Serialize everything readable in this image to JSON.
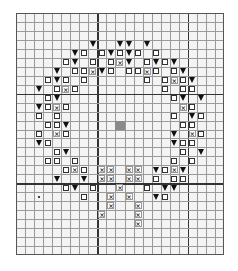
{
  "chart": {
    "columns": 23,
    "rows": 27,
    "thick_lines_cols": [
      9,
      19
    ],
    "thick_lines_rows": [
      9,
      19
    ],
    "colors": {
      "background": "#f4f4f4",
      "grid": "#9a9a9a",
      "thick_grid": "#333333",
      "triangle": "#111111",
      "center_fill": "#8a8a8a"
    },
    "legend_symbols": {
      "tri": "solid-down-triangle",
      "sq": "hollow-square",
      "x": "cross-in-box",
      "fill": "grey-filled-center",
      "dot": "stray-dot"
    },
    "cells": [
      {
        "r": 3,
        "c": 8,
        "s": "tri"
      },
      {
        "r": 3,
        "c": 11,
        "s": "tri"
      },
      {
        "r": 3,
        "c": 12,
        "s": "tri"
      },
      {
        "r": 3,
        "c": 14,
        "s": "tri"
      },
      {
        "r": 4,
        "c": 6,
        "s": "tri"
      },
      {
        "r": 4,
        "c": 7,
        "s": "sq"
      },
      {
        "r": 4,
        "c": 9,
        "s": "sq"
      },
      {
        "r": 4,
        "c": 10,
        "s": "tri"
      },
      {
        "r": 4,
        "c": 11,
        "s": "sq"
      },
      {
        "r": 4,
        "c": 12,
        "s": "tri"
      },
      {
        "r": 4,
        "c": 13,
        "s": "sq"
      },
      {
        "r": 4,
        "c": 15,
        "s": "sq"
      },
      {
        "r": 5,
        "c": 5,
        "s": "sq"
      },
      {
        "r": 5,
        "c": 6,
        "s": "tri"
      },
      {
        "r": 5,
        "c": 8,
        "s": "sq"
      },
      {
        "r": 5,
        "c": 10,
        "s": "sq"
      },
      {
        "r": 5,
        "c": 11,
        "s": "x"
      },
      {
        "r": 5,
        "c": 12,
        "s": "tri"
      },
      {
        "r": 5,
        "c": 14,
        "s": "sq"
      },
      {
        "r": 5,
        "c": 15,
        "s": "tri"
      },
      {
        "r": 5,
        "c": 16,
        "s": "sq"
      },
      {
        "r": 5,
        "c": 17,
        "s": "tri"
      },
      {
        "r": 6,
        "c": 4,
        "s": "tri"
      },
      {
        "r": 6,
        "c": 6,
        "s": "sq"
      },
      {
        "r": 6,
        "c": 7,
        "s": "sq"
      },
      {
        "r": 6,
        "c": 8,
        "s": "x"
      },
      {
        "r": 6,
        "c": 9,
        "s": "tri"
      },
      {
        "r": 6,
        "c": 10,
        "s": "sq"
      },
      {
        "r": 6,
        "c": 12,
        "s": "sq"
      },
      {
        "r": 6,
        "c": 13,
        "s": "sq"
      },
      {
        "r": 6,
        "c": 14,
        "s": "x"
      },
      {
        "r": 6,
        "c": 15,
        "s": "sq"
      },
      {
        "r": 6,
        "c": 17,
        "s": "sq"
      },
      {
        "r": 6,
        "c": 18,
        "s": "tri"
      },
      {
        "r": 7,
        "c": 3,
        "s": "sq"
      },
      {
        "r": 7,
        "c": 4,
        "s": "tri"
      },
      {
        "r": 7,
        "c": 5,
        "s": "sq"
      },
      {
        "r": 7,
        "c": 7,
        "s": "sq"
      },
      {
        "r": 7,
        "c": 14,
        "s": "sq"
      },
      {
        "r": 7,
        "c": 16,
        "s": "sq"
      },
      {
        "r": 7,
        "c": 17,
        "s": "x"
      },
      {
        "r": 7,
        "c": 18,
        "s": "sq"
      },
      {
        "r": 7,
        "c": 19,
        "s": "tri"
      },
      {
        "r": 8,
        "c": 2,
        "s": "tri"
      },
      {
        "r": 8,
        "c": 4,
        "s": "sq"
      },
      {
        "r": 8,
        "c": 5,
        "s": "x"
      },
      {
        "r": 8,
        "c": 6,
        "s": "sq"
      },
      {
        "r": 8,
        "c": 16,
        "s": "sq"
      },
      {
        "r": 8,
        "c": 18,
        "s": "sq"
      },
      {
        "r": 8,
        "c": 19,
        "s": "sq"
      },
      {
        "r": 9,
        "c": 3,
        "s": "sq"
      },
      {
        "r": 9,
        "c": 4,
        "s": "tri"
      },
      {
        "r": 9,
        "c": 17,
        "s": "sq"
      },
      {
        "r": 9,
        "c": 18,
        "s": "tri"
      },
      {
        "r": 9,
        "c": 20,
        "s": "tri"
      },
      {
        "r": 10,
        "c": 2,
        "s": "tri"
      },
      {
        "r": 10,
        "c": 3,
        "s": "sq"
      },
      {
        "r": 10,
        "c": 4,
        "s": "x"
      },
      {
        "r": 10,
        "c": 5,
        "s": "sq"
      },
      {
        "r": 10,
        "c": 18,
        "s": "x"
      },
      {
        "r": 10,
        "c": 19,
        "s": "sq"
      },
      {
        "r": 11,
        "c": 2,
        "s": "sq"
      },
      {
        "r": 11,
        "c": 4,
        "s": "sq"
      },
      {
        "r": 11,
        "c": 17,
        "s": "sq"
      },
      {
        "r": 11,
        "c": 19,
        "s": "tri"
      },
      {
        "r": 11,
        "c": 20,
        "s": "sq"
      },
      {
        "r": 12,
        "c": 3,
        "s": "sq"
      },
      {
        "r": 12,
        "c": 4,
        "s": "sq"
      },
      {
        "r": 12,
        "c": 5,
        "s": "tri"
      },
      {
        "r": 12,
        "c": 11,
        "s": "fill"
      },
      {
        "r": 12,
        "c": 18,
        "s": "sq"
      },
      {
        "r": 12,
        "c": 19,
        "s": "sq"
      },
      {
        "r": 13,
        "c": 2,
        "s": "sq"
      },
      {
        "r": 13,
        "c": 4,
        "s": "x"
      },
      {
        "r": 13,
        "c": 5,
        "s": "sq"
      },
      {
        "r": 13,
        "c": 17,
        "s": "tri"
      },
      {
        "r": 13,
        "c": 19,
        "s": "x"
      },
      {
        "r": 13,
        "c": 20,
        "s": "sq"
      },
      {
        "r": 14,
        "c": 2,
        "s": "tri"
      },
      {
        "r": 14,
        "c": 3,
        "s": "sq"
      },
      {
        "r": 14,
        "c": 17,
        "s": "tri"
      },
      {
        "r": 14,
        "c": 18,
        "s": "sq"
      },
      {
        "r": 14,
        "c": 19,
        "s": "sq"
      },
      {
        "r": 15,
        "c": 4,
        "s": "sq"
      },
      {
        "r": 15,
        "c": 5,
        "s": "tri"
      },
      {
        "r": 15,
        "c": 18,
        "s": "sq"
      },
      {
        "r": 15,
        "c": 20,
        "s": "tri"
      },
      {
        "r": 16,
        "c": 3,
        "s": "sq"
      },
      {
        "r": 16,
        "c": 4,
        "s": "sq"
      },
      {
        "r": 16,
        "c": 6,
        "s": "sq"
      },
      {
        "r": 16,
        "c": 17,
        "s": "sq"
      },
      {
        "r": 16,
        "c": 19,
        "s": "sq"
      },
      {
        "r": 17,
        "c": 5,
        "s": "sq"
      },
      {
        "r": 17,
        "c": 6,
        "s": "x"
      },
      {
        "r": 17,
        "c": 7,
        "s": "sq"
      },
      {
        "r": 17,
        "c": 9,
        "s": "x"
      },
      {
        "r": 17,
        "c": 10,
        "s": "x"
      },
      {
        "r": 17,
        "c": 12,
        "s": "x"
      },
      {
        "r": 17,
        "c": 13,
        "s": "x"
      },
      {
        "r": 17,
        "c": 15,
        "s": "tri"
      },
      {
        "r": 17,
        "c": 16,
        "s": "sq"
      },
      {
        "r": 17,
        "c": 17,
        "s": "x"
      },
      {
        "r": 17,
        "c": 18,
        "s": "tri"
      },
      {
        "r": 18,
        "c": 4,
        "s": "tri"
      },
      {
        "r": 18,
        "c": 7,
        "s": "tri"
      },
      {
        "r": 18,
        "c": 9,
        "s": "x"
      },
      {
        "r": 18,
        "c": 10,
        "s": "x"
      },
      {
        "r": 18,
        "c": 12,
        "s": "x"
      },
      {
        "r": 18,
        "c": 13,
        "s": "x"
      },
      {
        "r": 18,
        "c": 15,
        "s": "sq"
      },
      {
        "r": 18,
        "c": 17,
        "s": "sq"
      },
      {
        "r": 18,
        "c": 18,
        "s": "sq"
      },
      {
        "r": 19,
        "c": 5,
        "s": "sq"
      },
      {
        "r": 19,
        "c": 6,
        "s": "tri"
      },
      {
        "r": 19,
        "c": 8,
        "s": "sq"
      },
      {
        "r": 19,
        "c": 11,
        "s": "x"
      },
      {
        "r": 19,
        "c": 14,
        "s": "sq"
      },
      {
        "r": 19,
        "c": 16,
        "s": "tri"
      },
      {
        "r": 19,
        "c": 17,
        "s": "tri"
      },
      {
        "r": 20,
        "c": 2,
        "s": "dot"
      },
      {
        "r": 20,
        "c": 7,
        "s": "sq"
      },
      {
        "r": 20,
        "c": 10,
        "s": "x"
      },
      {
        "r": 20,
        "c": 12,
        "s": "x"
      },
      {
        "r": 20,
        "c": 15,
        "s": "tri"
      },
      {
        "r": 20,
        "c": 16,
        "s": "sq"
      },
      {
        "r": 21,
        "c": 10,
        "s": "x"
      },
      {
        "r": 21,
        "c": 13,
        "s": "x"
      },
      {
        "r": 22,
        "c": 9,
        "s": "x"
      },
      {
        "r": 22,
        "c": 13,
        "s": "x"
      },
      {
        "r": 23,
        "c": 13,
        "s": "x"
      }
    ],
    "x_glyph": "×"
  }
}
